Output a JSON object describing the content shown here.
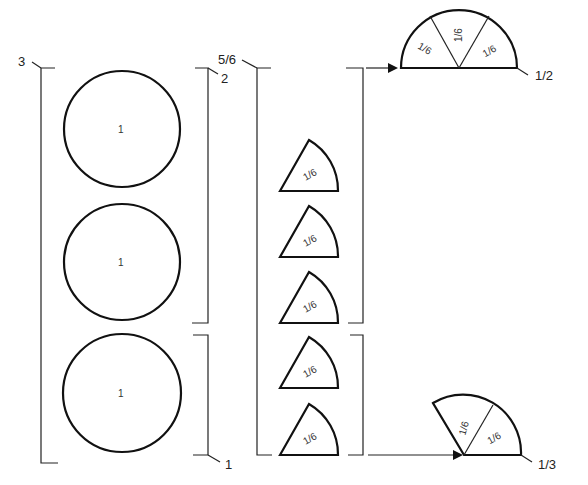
{
  "diagram": {
    "left_group": {
      "bracket_label_total": "3",
      "bracket_label_upper": "2",
      "bracket_label_lower": "1",
      "circles": [
        {
          "label": "1"
        },
        {
          "label": "1"
        },
        {
          "label": "1"
        }
      ]
    },
    "middle_group": {
      "bracket_label_total": "5/6",
      "sectors": [
        {
          "label": "1/6"
        },
        {
          "label": "1/6"
        },
        {
          "label": "1/6"
        },
        {
          "label": "1/6"
        },
        {
          "label": "1/6"
        }
      ]
    },
    "results": {
      "top": {
        "label": "1/2",
        "parts": [
          "1/6",
          "1/6",
          "1/6"
        ]
      },
      "bottom": {
        "label": "1/3",
        "parts": [
          "1/6",
          "1/6"
        ]
      }
    }
  }
}
